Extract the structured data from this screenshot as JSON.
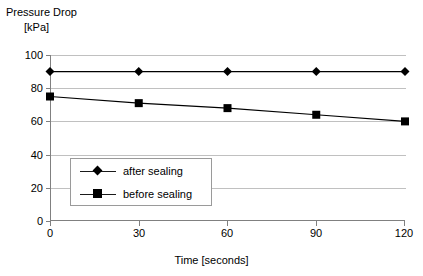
{
  "chart_data": {
    "type": "line",
    "title": "",
    "xlabel": "Time [seconds]",
    "ylabel_line1": "Pressure Drop",
    "ylabel_line2": "[kPa]",
    "x": [
      0,
      30,
      60,
      90,
      120
    ],
    "xticks": [
      "0",
      "30",
      "60",
      "90",
      "120"
    ],
    "yticks": [
      "0",
      "20",
      "40",
      "60",
      "80",
      "100"
    ],
    "xlim": [
      0,
      120
    ],
    "ylim": [
      0,
      100
    ],
    "grid": "horizontal",
    "legend_position": "center-left-inside",
    "series": [
      {
        "name": "after sealing",
        "marker": "diamond",
        "color": "#000000",
        "values": [
          90,
          90,
          90,
          90,
          90
        ]
      },
      {
        "name": "before sealing",
        "marker": "square",
        "color": "#000000",
        "values": [
          75,
          71,
          68,
          64,
          60
        ]
      }
    ]
  },
  "legend": {
    "items": [
      {
        "label": "after sealing",
        "marker": "diamond-marker-icon"
      },
      {
        "label": "before sealing",
        "marker": "square-marker-icon"
      }
    ]
  },
  "colors": {
    "grid": "#c0c0c0",
    "axis": "#808080",
    "series": "#000000",
    "background": "#ffffff"
  }
}
